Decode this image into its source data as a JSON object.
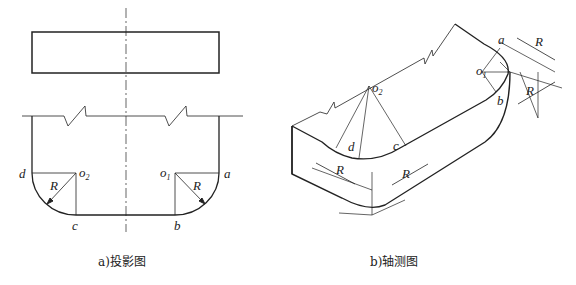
{
  "figure_a": {
    "caption": "a)投影图",
    "labels": {
      "d": "d",
      "o2": "o",
      "o2_sub": "2",
      "o1": "o",
      "o1_sub": "1",
      "a": "a",
      "b": "b",
      "c": "c",
      "R_left": "R",
      "R_right": "R"
    }
  },
  "figure_b": {
    "caption": "b)轴测图",
    "labels": {
      "a": "a",
      "b": "b",
      "c": "c",
      "d": "d",
      "o1": "o",
      "o1_sub": "1",
      "o2": "o",
      "o2_sub": "2",
      "R1": "R",
      "R2": "R",
      "R3": "R",
      "R4": "R"
    }
  }
}
